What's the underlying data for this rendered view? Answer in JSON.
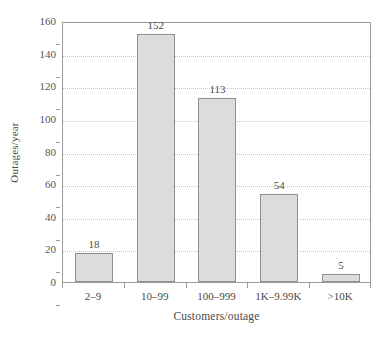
{
  "chart_data": {
    "type": "bar",
    "title": "",
    "subtitle": "",
    "xlabel": "Customers/outage",
    "ylabel": "Outages/year",
    "categories": [
      "2–9",
      "10–99",
      "100–999",
      "1K–9.99K",
      ">10K"
    ],
    "values": [
      18,
      152,
      113,
      54,
      5
    ],
    "value_labels": [
      "18",
      "152",
      "113",
      "54",
      "5"
    ],
    "ylim": [
      0,
      160
    ],
    "yticks": [
      0,
      20,
      40,
      60,
      80,
      100,
      120,
      140,
      160
    ],
    "ytick_labels": [
      "0",
      "20",
      "40",
      "60",
      "80",
      "100",
      "120",
      "140",
      "160"
    ],
    "grid": "horizontal-dotted",
    "legend": "none",
    "bar_fill_color": "#dcdcdc",
    "bar_border_color": "#8f8f8f",
    "axis_color": "#9a9a9a",
    "grid_color": "#c4c4c4",
    "text_color": "#4a4a4a",
    "background_color": "#ffffff"
  }
}
